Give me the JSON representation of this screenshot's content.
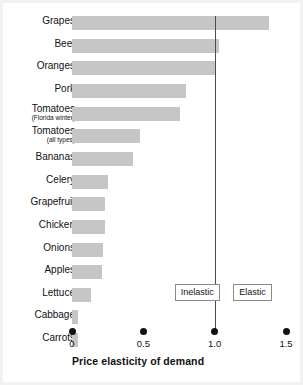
{
  "chart_data": {
    "type": "bar",
    "orientation": "horizontal",
    "title": "",
    "xlabel": "Price elasticity of demand",
    "ylabel": "",
    "xlim": [
      0,
      1.55
    ],
    "xticks": [
      0,
      0.5,
      1.0,
      1.5
    ],
    "xtick_labels": [
      "0",
      "0.5",
      "1.0",
      "1.5"
    ],
    "grid": false,
    "legend": "none",
    "categories": [
      "Grapes",
      "Beef",
      "Oranges",
      "Pork",
      "Tomatoes (Florida winter)",
      "Tomatoes (all types)",
      "Bananas",
      "Celery",
      "Grapefruit",
      "Chicken",
      "Onions",
      "Apples",
      "Lettuce",
      "Cabbage",
      "Carrots"
    ],
    "values": [
      1.38,
      1.03,
      1.0,
      0.8,
      0.76,
      0.48,
      0.43,
      0.25,
      0.23,
      0.23,
      0.22,
      0.21,
      0.13,
      0.04,
      0.04
    ],
    "reference_line": {
      "value": 1.0,
      "label": "unit elasticity"
    },
    "annotations": [
      {
        "text": "Inelastic",
        "x": 0.72
      },
      {
        "text": "Elastic",
        "x": 1.13
      }
    ],
    "colors": {
      "bar": "#c6c6c6",
      "reference_line": "#4c4c4c",
      "text": "#111111",
      "background": "#ffffff"
    }
  },
  "rows": [
    {
      "label": "Grapes",
      "sub": "",
      "value": 1.38
    },
    {
      "label": "Beef",
      "sub": "",
      "value": 1.03
    },
    {
      "label": "Oranges",
      "sub": "",
      "value": 1.0
    },
    {
      "label": "Pork",
      "sub": "",
      "value": 0.8
    },
    {
      "label": "Tomatoes",
      "sub": "(Florida winter)",
      "value": 0.76
    },
    {
      "label": "Tomatoes",
      "sub": "(all types)",
      "value": 0.48
    },
    {
      "label": "Bananas",
      "sub": "",
      "value": 0.43
    },
    {
      "label": "Celery",
      "sub": "",
      "value": 0.25
    },
    {
      "label": "Grapefruit",
      "sub": "",
      "value": 0.23
    },
    {
      "label": "Chicken",
      "sub": "",
      "value": 0.23
    },
    {
      "label": "Onions",
      "sub": "",
      "value": 0.22
    },
    {
      "label": "Apples",
      "sub": "",
      "value": 0.21
    },
    {
      "label": "Lettuce",
      "sub": "",
      "value": 0.13
    },
    {
      "label": "Cabbage",
      "sub": "",
      "value": 0.04
    },
    {
      "label": "Carrots",
      "sub": "",
      "value": 0.04
    }
  ],
  "axis": {
    "title": "Price elasticity of demand",
    "ticks": [
      {
        "label": "0",
        "value": 0
      },
      {
        "label": "0.5",
        "value": 0.5
      },
      {
        "label": "1.0",
        "value": 1.0
      },
      {
        "label": "1.5",
        "value": 1.5
      }
    ]
  },
  "annotations": {
    "inelastic": "Inelastic",
    "elastic": "Elastic"
  }
}
